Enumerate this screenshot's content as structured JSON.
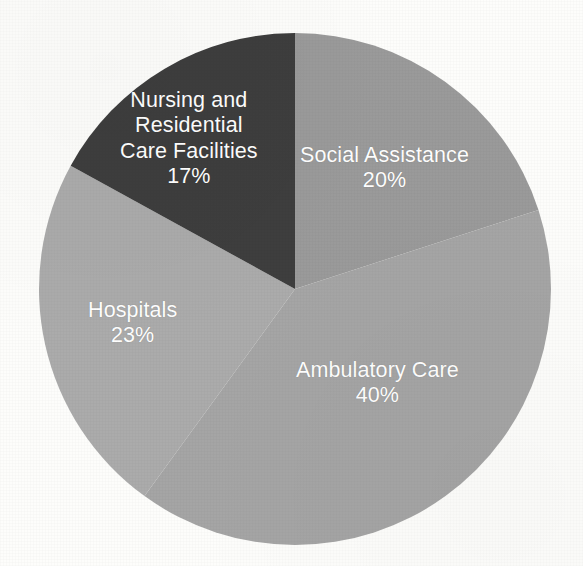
{
  "chart_data": {
    "type": "pie",
    "title": "",
    "subtitle": "",
    "xlabel": "",
    "ylabel": "",
    "legend_position": "none",
    "grid": false,
    "labels_inside_slices": true,
    "start_angle_deg": 0,
    "direction": "clockwise",
    "categories": [
      "Social Assistance",
      "Ambulatory Care",
      "Hospitals",
      "Nursing and Residential Care Facilities"
    ],
    "values": [
      20,
      40,
      23,
      17
    ],
    "value_suffix": "%",
    "colors": [
      "#9a9a9a",
      "#a5a5a5",
      "#ababab",
      "#3e3e3e"
    ],
    "slices": [
      {
        "name": "Social Assistance",
        "value": 20,
        "value_text": "20%",
        "color": "#9a9a9a",
        "label_color": "#ffffff",
        "label_lines": [
          "Social Assistance"
        ]
      },
      {
        "name": "Ambulatory Care",
        "value": 40,
        "value_text": "40%",
        "color": "#a5a5a5",
        "label_color": "#ffffff",
        "label_lines": [
          "Ambulatory Care"
        ]
      },
      {
        "name": "Hospitals",
        "value": 23,
        "value_text": "23%",
        "color": "#ababab",
        "label_color": "#ffffff",
        "label_lines": [
          "Hospitals"
        ]
      },
      {
        "name": "Nursing and Residential Care Facilities",
        "value": 17,
        "value_text": "17%",
        "color": "#3e3e3e",
        "label_color": "#ffffff",
        "label_lines": [
          "Nursing and",
          "Residential",
          "Care Facilities"
        ]
      }
    ]
  },
  "labels": {
    "social_assistance": {
      "line1": "Social Assistance",
      "percent": "20%"
    },
    "ambulatory_care": {
      "line1": "Ambulatory Care",
      "percent": "40%"
    },
    "hospitals": {
      "line1": "Hospitals",
      "percent": "23%"
    },
    "nursing_residential": {
      "line1": "Nursing and",
      "line2": "Residential",
      "line3": "Care Facilities",
      "percent": "17%"
    }
  },
  "canvas": {
    "background_color": "#fdfdfb",
    "center_x": 295,
    "center_y": 289,
    "radius": 256
  }
}
